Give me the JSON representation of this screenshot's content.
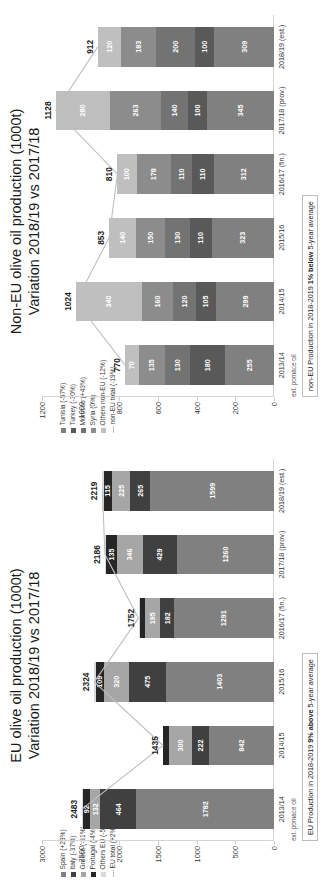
{
  "charts": [
    {
      "id": "eu",
      "title_line1": "EU olive oil production (1000t)",
      "title_line2": "Variation 2018/19 vs 2017/18",
      "legend": [
        {
          "label": "Spain (+23%)",
          "color": "#808080",
          "type": "swatch"
        },
        {
          "label": "Italy (-37%)",
          "color": "#404040",
          "type": "swatch"
        },
        {
          "label": "Greece (-31%)",
          "color": "#a6a6a6",
          "type": "swatch"
        },
        {
          "label": "Portugal (-4%)",
          "color": "#262626",
          "type": "swatch"
        },
        {
          "label": "Others EU (-5%)",
          "color": "#d9d9d9",
          "type": "swatch"
        },
        {
          "label": "EU total (+2%)",
          "color": "#bfbfbf",
          "type": "line"
        }
      ],
      "footnote": "exl. pomace oil",
      "note_prefix": "EU Production in 2018-2019 ",
      "note_bold": "9% above",
      "note_suffix": " 5-year average",
      "chart_data": {
        "type": "bar",
        "title": "EU olive oil production (1000t) Variation 2018/19 vs 2017/18",
        "xlabel": "",
        "ylabel": "1000 t",
        "ylim": [
          0,
          3000
        ],
        "yticks": [
          0,
          500,
          1000,
          1500,
          2000,
          2500,
          3000
        ],
        "grid": false,
        "legend_position": "top-left",
        "stacked": true,
        "categories": [
          "2013/14",
          "2014/15",
          "2015/16",
          "2016/17 (fin.)",
          "2017/18 (prov.)",
          "2018/19 (est.)"
        ],
        "series": [
          {
            "name": "Spain (+23%)",
            "color": "#808080",
            "values": [
              1782,
              842,
              1403,
              1291,
              1260,
              1599
            ]
          },
          {
            "name": "Italy (-37%)",
            "color": "#404040",
            "values": [
              464,
              222,
              475,
              182,
              429,
              265
            ]
          },
          {
            "name": "Greece (-31%)",
            "color": "#a6a6a6",
            "values": [
              132,
              300,
              320,
              195,
              346,
              225
            ]
          },
          {
            "name": "Portugal (-4%)",
            "color": "#262626",
            "values": [
              92,
              71,
              109,
              69,
              135,
              115
            ]
          },
          {
            "name": "Others EU (-5%)",
            "color": "#d9d9d9",
            "values": [
              13,
              0,
              17,
              15,
              16,
              15
            ]
          }
        ],
        "totals_line": {
          "name": "EU total (+2%)",
          "color": "#bfbfbf",
          "values": [
            2483,
            1435,
            2324,
            1752,
            2186,
            2219
          ]
        }
      }
    },
    {
      "id": "noneu",
      "title_line1": "Non-EU olive oil production (1000t)",
      "title_line2": "Variation 2018/19 vs 2017/18",
      "legend": [
        {
          "label": "Tunisia (-57%)",
          "color": "#808080",
          "type": "swatch"
        },
        {
          "label": "Turkey (-30%)",
          "color": "#595959",
          "type": "swatch"
        },
        {
          "label": "Morocco (+43%)",
          "color": "#737373",
          "type": "swatch"
        },
        {
          "label": "Syria (0%)",
          "color": "#8c8c8c",
          "type": "swatch"
        },
        {
          "label": "Others non-EU (-12%)",
          "color": "#bfbfbf",
          "type": "swatch"
        },
        {
          "label": "non-EU total (-19%)",
          "color": "#bfbfbf",
          "type": "line"
        }
      ],
      "footnote": "exl. pomace oil",
      "note_prefix": "non-EU Production in 2018-2019 ",
      "note_bold": "1% below",
      "note_suffix": " 5-year average",
      "chart_data": {
        "type": "bar",
        "title": "Non-EU olive oil production (1000t) Variation 2018/19 vs 2017/18",
        "xlabel": "",
        "ylabel": "1000 t",
        "ylim": [
          0,
          1200
        ],
        "yticks": [
          0,
          200,
          400,
          600,
          800,
          1000,
          1200
        ],
        "grid": false,
        "legend_position": "top-left",
        "stacked": true,
        "categories": [
          "2013/14",
          "2014/15",
          "2015/16",
          "2016/17 (fin.)",
          "2017/18 (prov.)",
          "2018/19 (est.)"
        ],
        "series": [
          {
            "name": "Tunisia (-57%)",
            "color": "#808080",
            "values": [
              255,
              299,
              323,
              312,
              345,
              309
            ]
          },
          {
            "name": "Turkey (-30%)",
            "color": "#595959",
            "values": [
              180,
              105,
              110,
              110,
              100,
              100
            ]
          },
          {
            "name": "Morocco (+43%)",
            "color": "#737373",
            "values": [
              130,
              120,
              130,
              110,
              140,
              200
            ]
          },
          {
            "name": "Syria (0%)",
            "color": "#8c8c8c",
            "values": [
              135,
              160,
              150,
              178,
              263,
              183
            ]
          },
          {
            "name": "Others non-EU (-12%)",
            "color": "#bfbfbf",
            "values": [
              70,
              340,
              140,
              100,
              280,
              120
            ]
          }
        ],
        "totals_line": {
          "name": "non-EU total (-19%)",
          "color": "#bfbfbf",
          "values": [
            770,
            1024,
            853,
            810,
            1128,
            912
          ]
        }
      }
    }
  ]
}
